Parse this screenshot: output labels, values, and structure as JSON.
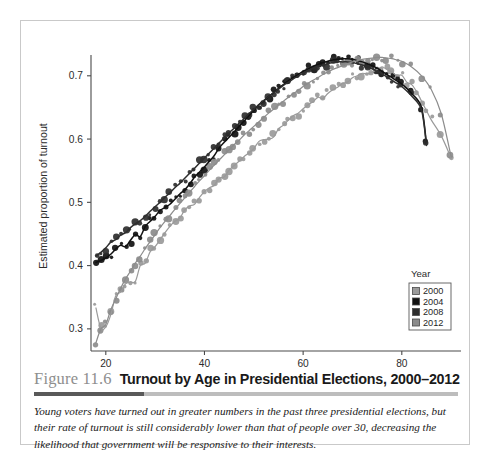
{
  "figure": {
    "number": "Figure 11.6",
    "title": "Turnout by Age in Presidential Elections, 2000–2012",
    "caption": "Young voters have turned out in greater numbers in the past three presidential elections, but their rate of turnout is still considerably lower than that of people over 30, decreasing the likelihood that government will be responsive to their interests."
  },
  "chart_data": {
    "type": "scatter",
    "title": "",
    "xlabel": "Age",
    "ylabel": "Estimated proportion of turnout",
    "xlim": [
      17,
      92
    ],
    "ylim": [
      0.265,
      0.755
    ],
    "xticks": [
      20,
      40,
      60,
      80
    ],
    "yticks": [
      0.3,
      0.4,
      0.5,
      0.6,
      0.7
    ],
    "xtick_labels": [
      "20",
      "40",
      "60",
      "80"
    ],
    "ytick_labels": [
      "0.3",
      "0.4",
      "0.5",
      "0.6",
      "0.7"
    ],
    "grid": false,
    "legend": {
      "title": "Year",
      "position": "lower-right",
      "entries": [
        {
          "label": "2000",
          "color": "#9a9a9a"
        },
        {
          "label": "2004",
          "color": "#111111"
        },
        {
          "label": "2008",
          "color": "#2e2e2e"
        },
        {
          "label": "2012",
          "color": "#8c8c8c"
        }
      ]
    },
    "series": [
      {
        "name": "2000",
        "color": "#9a9a9a",
        "marker": "circle",
        "fit": "loess",
        "x": [
          18,
          19,
          20,
          21,
          22,
          23,
          24,
          25,
          26,
          27,
          28,
          29,
          30,
          31,
          32,
          33,
          34,
          35,
          36,
          37,
          38,
          39,
          40,
          41,
          42,
          43,
          44,
          45,
          46,
          47,
          48,
          49,
          50,
          51,
          52,
          53,
          54,
          55,
          56,
          57,
          58,
          59,
          60,
          61,
          62,
          63,
          64,
          65,
          66,
          67,
          68,
          69,
          70,
          71,
          72,
          73,
          74,
          75,
          76,
          77,
          78,
          79,
          80,
          81,
          82,
          83,
          84,
          85,
          86,
          88,
          90
        ],
        "y": [
          0.333,
          0.301,
          0.303,
          0.322,
          0.352,
          0.358,
          0.371,
          0.374,
          0.375,
          0.4,
          0.404,
          0.422,
          0.43,
          0.441,
          0.452,
          0.462,
          0.47,
          0.475,
          0.488,
          0.494,
          0.497,
          0.508,
          0.517,
          0.523,
          0.527,
          0.538,
          0.54,
          0.551,
          0.558,
          0.565,
          0.572,
          0.578,
          0.585,
          0.596,
          0.599,
          0.6,
          0.603,
          0.616,
          0.622,
          0.63,
          0.637,
          0.641,
          0.648,
          0.654,
          0.659,
          0.666,
          0.664,
          0.672,
          0.678,
          0.682,
          0.688,
          0.69,
          0.697,
          0.7,
          0.704,
          0.703,
          0.706,
          0.71,
          0.714,
          0.71,
          0.706,
          0.7,
          0.701,
          0.69,
          0.686,
          0.675,
          0.66,
          0.645,
          0.63,
          0.605,
          0.57
        ]
      },
      {
        "name": "2004",
        "color": "#111111",
        "marker": "circle",
        "fit": "loess",
        "x": [
          18,
          19,
          20,
          21,
          22,
          23,
          24,
          25,
          26,
          27,
          28,
          29,
          30,
          31,
          32,
          33,
          34,
          35,
          36,
          37,
          38,
          39,
          40,
          41,
          42,
          43,
          44,
          45,
          46,
          47,
          48,
          49,
          50,
          51,
          52,
          53,
          54,
          55,
          56,
          57,
          58,
          59,
          60,
          61,
          62,
          63,
          64,
          65,
          66,
          67,
          68,
          69,
          70,
          71,
          72,
          73,
          74,
          75,
          76,
          77,
          78,
          79,
          80,
          82,
          84,
          85
        ],
        "y": [
          0.405,
          0.408,
          0.412,
          0.418,
          0.426,
          0.432,
          0.43,
          0.44,
          0.449,
          0.446,
          0.462,
          0.47,
          0.478,
          0.487,
          0.492,
          0.497,
          0.505,
          0.513,
          0.52,
          0.529,
          0.54,
          0.548,
          0.556,
          0.565,
          0.574,
          0.586,
          0.595,
          0.603,
          0.611,
          0.62,
          0.628,
          0.637,
          0.645,
          0.654,
          0.66,
          0.667,
          0.673,
          0.68,
          0.686,
          0.692,
          0.697,
          0.702,
          0.707,
          0.711,
          0.715,
          0.718,
          0.721,
          0.723,
          0.725,
          0.726,
          0.727,
          0.727,
          0.726,
          0.724,
          0.722,
          0.719,
          0.716,
          0.712,
          0.707,
          0.702,
          0.697,
          0.692,
          0.687,
          0.672,
          0.65,
          0.592
        ]
      },
      {
        "name": "2008",
        "color": "#2e2e2e",
        "marker": "circle",
        "fit": "loess",
        "x": [
          18,
          19,
          20,
          21,
          22,
          23,
          24,
          25,
          26,
          27,
          28,
          29,
          30,
          31,
          32,
          33,
          34,
          35,
          36,
          37,
          38,
          39,
          40,
          41,
          42,
          43,
          44,
          45,
          46,
          47,
          48,
          49,
          50,
          51,
          52,
          53,
          54,
          55,
          56,
          57,
          58,
          59,
          60,
          61,
          62,
          63,
          64,
          65,
          66,
          67,
          68,
          69,
          70,
          71,
          72,
          73,
          74,
          75,
          76,
          77,
          78,
          79,
          80,
          82,
          84,
          85
        ],
        "y": [
          0.415,
          0.421,
          0.428,
          0.437,
          0.441,
          0.448,
          0.452,
          0.46,
          0.466,
          0.471,
          0.478,
          0.486,
          0.493,
          0.5,
          0.508,
          0.515,
          0.523,
          0.53,
          0.538,
          0.546,
          0.554,
          0.562,
          0.57,
          0.578,
          0.586,
          0.594,
          0.602,
          0.61,
          0.617,
          0.625,
          0.632,
          0.64,
          0.647,
          0.654,
          0.661,
          0.667,
          0.673,
          0.679,
          0.685,
          0.69,
          0.695,
          0.7,
          0.704,
          0.708,
          0.712,
          0.715,
          0.717,
          0.719,
          0.721,
          0.722,
          0.722,
          0.722,
          0.721,
          0.719,
          0.717,
          0.714,
          0.711,
          0.707,
          0.703,
          0.698,
          0.693,
          0.688,
          0.683,
          0.668,
          0.646,
          0.59
        ]
      },
      {
        "name": "2012",
        "color": "#8c8c8c",
        "marker": "circle",
        "fit": "loess",
        "x": [
          18,
          19,
          20,
          21,
          22,
          23,
          24,
          25,
          26,
          27,
          28,
          29,
          30,
          31,
          32,
          33,
          34,
          35,
          36,
          37,
          38,
          39,
          40,
          41,
          42,
          43,
          44,
          45,
          46,
          47,
          48,
          49,
          50,
          51,
          52,
          53,
          54,
          55,
          56,
          57,
          58,
          59,
          60,
          61,
          62,
          63,
          64,
          65,
          66,
          67,
          68,
          69,
          70,
          71,
          72,
          73,
          74,
          75,
          76,
          77,
          78,
          79,
          80,
          82,
          84,
          86,
          88,
          90
        ],
        "y": [
          0.278,
          0.3,
          0.307,
          0.33,
          0.347,
          0.364,
          0.379,
          0.391,
          0.404,
          0.415,
          0.427,
          0.438,
          0.449,
          0.46,
          0.47,
          0.479,
          0.489,
          0.498,
          0.507,
          0.516,
          0.525,
          0.534,
          0.542,
          0.551,
          0.559,
          0.567,
          0.575,
          0.583,
          0.591,
          0.598,
          0.606,
          0.613,
          0.62,
          0.627,
          0.634,
          0.641,
          0.647,
          0.654,
          0.66,
          0.666,
          0.672,
          0.677,
          0.683,
          0.688,
          0.693,
          0.697,
          0.702,
          0.706,
          0.71,
          0.713,
          0.716,
          0.719,
          0.722,
          0.724,
          0.726,
          0.727,
          0.728,
          0.729,
          0.729,
          0.728,
          0.727,
          0.725,
          0.723,
          0.714,
          0.7,
          0.678,
          0.64,
          0.572
        ]
      }
    ]
  }
}
